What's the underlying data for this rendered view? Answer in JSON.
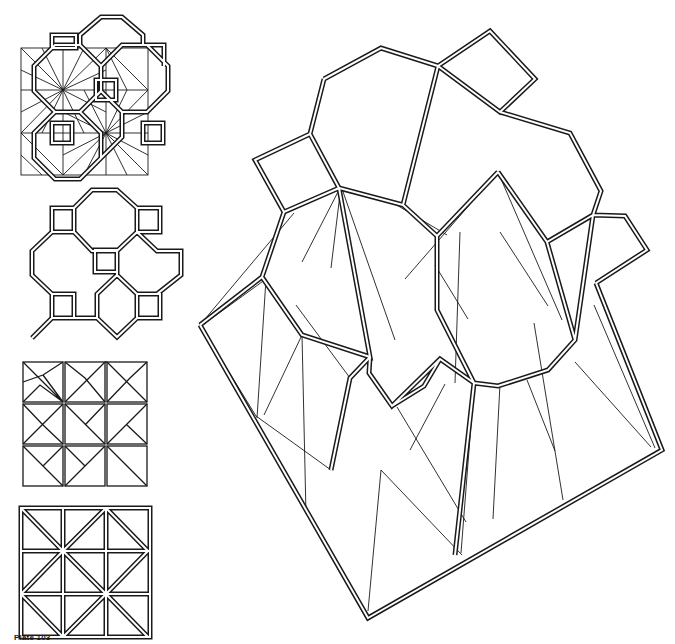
{
  "caption": "Plate 103",
  "colors": {
    "ink": "#1a1a1a",
    "paper": "#ffffff"
  },
  "figures": [
    {
      "id": "fig-a",
      "description": "Square grid of octagons and squares overlaid with radiating folding lines"
    },
    {
      "id": "fig-b",
      "description": "Outline of octagon-and-square tessellation with double-line edges"
    },
    {
      "id": "fig-c",
      "description": "3x3 grid of squares with star-like radiating crease pattern"
    },
    {
      "id": "fig-d",
      "description": "3x3 grid of squares with diagonal double lines"
    },
    {
      "id": "fig-main",
      "description": "Large rotated octagon-and-square tessellation with triangulated folding pattern"
    }
  ]
}
